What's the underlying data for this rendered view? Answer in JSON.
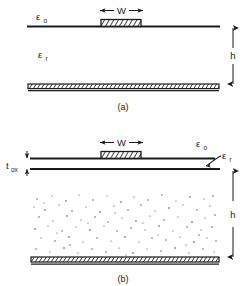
{
  "figure": {
    "parts": [
      {
        "caption": "(a)",
        "name": "conventional-microstrip",
        "labels": {
          "eps_free": "ε",
          "eps_free_sub": "o",
          "eps_sub": "ε",
          "eps_sub_sub": "r",
          "width": "W",
          "height": "h",
          "left_arrow": "←",
          "right_arrow": "→"
        }
      },
      {
        "caption": "(b)",
        "name": "oxide-coated-microstrip",
        "labels": {
          "eps_free": "ε",
          "eps_free_sub": "o",
          "eps_sub": "ε",
          "eps_sub_sub": "r",
          "width": "W",
          "height": "h",
          "oxide": "t",
          "oxide_sub": "ox",
          "left_arrow": "←",
          "right_arrow": "→"
        }
      }
    ]
  },
  "colors": {
    "ink": "#1a1a1a",
    "line": "#222222",
    "stipple": "#555555",
    "background": "#ffffff"
  }
}
